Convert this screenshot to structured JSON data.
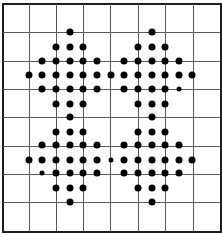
{
  "grid": {
    "columns": 8,
    "rows": 8,
    "vertical_lines_x": [
      28.7,
      55.7,
      83,
      110.3,
      137.7,
      165.3,
      192.7
    ],
    "horizontal_lines_y": [
      32.3,
      61,
      89,
      117.3,
      145.7,
      173.7,
      201.7
    ],
    "border_color": "#1e1e1e",
    "line_color": "#5a5a5a",
    "dot_color": "#000000"
  },
  "dot_positions": {
    "x": [
      2,
      15.6,
      29,
      42.3,
      55.7,
      69.7,
      83,
      96.7,
      110.7,
      124.3,
      138,
      151.7,
      165.3,
      178.7,
      192.3,
      206,
      220
    ],
    "y": [
      3,
      18,
      32.3,
      47,
      61,
      75,
      89,
      103.7,
      117.3,
      131.7,
      145.3,
      160,
      173.3,
      188.3,
      202,
      216,
      231
    ]
  },
  "diamonds": [
    {
      "name": "top-left",
      "center_col": 5,
      "center_row": 5,
      "radius": 3
    },
    {
      "name": "top-right",
      "center_col": 11,
      "center_row": 5,
      "radius": 3
    },
    {
      "name": "bottom-left",
      "center_col": 5,
      "center_row": 11,
      "radius": 3
    },
    {
      "name": "bottom-right",
      "center_col": 11,
      "center_row": 11,
      "radius": 3
    }
  ],
  "small_dots": [
    {
      "col": 13,
      "row": 6
    },
    {
      "col": 3,
      "row": 12
    },
    {
      "col": 8,
      "row": 11
    }
  ]
}
